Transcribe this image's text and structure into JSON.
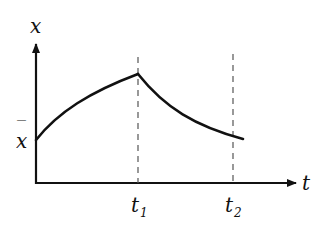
{
  "diagram": {
    "type": "time-response-curve",
    "axes": {
      "y_label": "x",
      "x_label": "t"
    },
    "levels": {
      "baseline_label": "x̄",
      "baseline_bar": "‾",
      "baseline_letter": "x"
    },
    "time_markers": [
      {
        "name": "t1",
        "base": "t",
        "sub": "1"
      },
      {
        "name": "t2",
        "base": "t",
        "sub": "2"
      }
    ],
    "curve": {
      "description": "Rises from baseline x̄ at t=0 to a peak at t1 (concave), then decays back toward x̄ by t2",
      "segments": [
        "rise 0→t1",
        "decay t1→t2"
      ]
    },
    "colors": {
      "line": "#111111",
      "dashed": "#555555",
      "background": "#ffffff"
    }
  }
}
